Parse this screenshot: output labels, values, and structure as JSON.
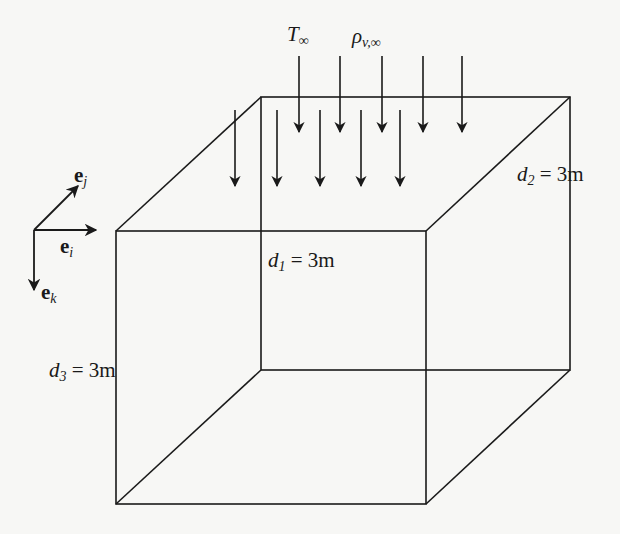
{
  "diagram": {
    "title": "",
    "type": "3D box with downward flux arrows and coordinate basis",
    "labels": {
      "t_inf": {
        "base": "T",
        "sub": "∞"
      },
      "rho_inf": {
        "base": "ρ",
        "sub": "v,∞"
      },
      "d1": {
        "base": "d",
        "sub": "1",
        "rest": " = 3m"
      },
      "d2": {
        "base": "d",
        "sub": "2",
        "rest": " = 3m"
      },
      "d3": {
        "base": "d",
        "sub": "3",
        "rest": " = 3m"
      },
      "ei": {
        "base": "e",
        "sub": "i"
      },
      "ej": {
        "base": "e",
        "sub": "j"
      },
      "ek": {
        "base": "e",
        "sub": "k"
      }
    },
    "colors": {
      "line": "#1a1a1a",
      "background": "#f7f7f5"
    }
  }
}
